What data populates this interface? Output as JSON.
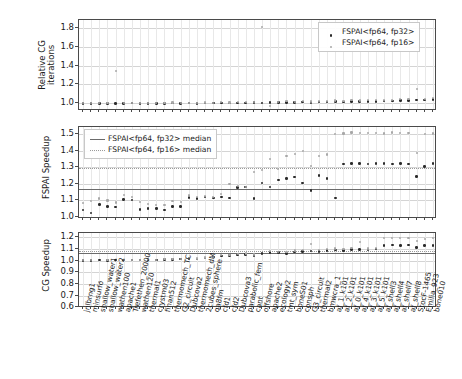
{
  "figure": {
    "type": "multi-panel-scatter",
    "n_matrices": 55
  },
  "chart_data": {
    "type": "scatter",
    "title": "",
    "xlabel": "",
    "legend_position": "top-right (panel 1), top-left (panel 2)",
    "grid": true,
    "categories": [
      "jnlbrng1",
      "minsurfo",
      "shallow_water1",
      "shallow_water2",
      "wathen100",
      "apache1",
      "Trefethen_20000",
      "wathen120",
      "thermal1",
      "crystm03",
      "finan512",
      "thermomech_TC",
      "G2_circuit",
      "Dubcova2",
      "thermomech_dM",
      "2cubes_sphere",
      "qa8fm",
      "cfd1",
      "cfd2",
      "Dubcova3",
      "parabolic_fem",
      "cant",
      "offshore",
      "apache2",
      "ecology2",
      "tmt_sym",
      "boneS01",
      "consph",
      "G3_circuit",
      "thermal2",
      "bmwcra_1",
      "af_1_k101",
      "af_2_k101",
      "af_0_k101",
      "af_4_k101",
      "af_3_k101",
      "af_5_k101",
      "af_shell3",
      "af_shell4",
      "af_shell7",
      "af_shell8",
      "StocF-1465",
      "Emilia_923",
      "bone010"
    ],
    "panels": [
      {
        "id": "relative-cg-iterations",
        "ylabel": "Relative CG\niterations",
        "ylabel_line1": "Relative CG",
        "ylabel_line2": "iterations",
        "yticks": [
          1.0,
          1.2,
          1.4,
          1.6,
          1.8
        ],
        "ylim": [
          0.92,
          1.88
        ],
        "series": [
          {
            "name": "FSPAI<fp64, fp32>",
            "marker": "dot-dark",
            "values": [
              1.0,
              1.001,
              1.0,
              1.0,
              1.002,
              1.001,
              1.003,
              1.0,
              1.002,
              1.001,
              1.0,
              1.004,
              1.002,
              1.003,
              1.002,
              1.004,
              1.003,
              1.005,
              1.004,
              1.006,
              1.005,
              1.008,
              1.006,
              1.01,
              1.008,
              1.012,
              1.01,
              1.014,
              1.012,
              1.016,
              1.014,
              1.018,
              1.016,
              1.02,
              1.018,
              1.022,
              1.02,
              1.024,
              1.026,
              1.028,
              1.03,
              1.034,
              1.038,
              1.044
            ]
          },
          {
            "name": "FSPAI<fp64, fp16>",
            "marker": "dot-light",
            "values": [
              1.002,
              1.003,
              1.002,
              1.004,
              1.34,
              1.003,
              1.006,
              1.004,
              1.006,
              1.005,
              1.004,
              1.01,
              1.006,
              1.008,
              1.006,
              1.01,
              1.008,
              1.012,
              1.01,
              1.014,
              1.012,
              1.018,
              1.81,
              0.975,
              1.016,
              1.022,
              1.018,
              1.024,
              1.02,
              1.028,
              1.024,
              1.03,
              1.026,
              1.034,
              1.03,
              1.036,
              1.032,
              1.038,
              1.04,
              1.044,
              1.046,
              1.15,
              1.05,
              1.056
            ]
          }
        ]
      },
      {
        "id": "fspai-speedup",
        "ylabel": "FSPAI Speedup",
        "yticks": [
          1.0,
          1.1,
          1.2,
          1.3,
          1.4,
          1.5
        ],
        "ylim": [
          0.985,
          1.545
        ],
        "median_lines": [
          {
            "name": "FSPAI<fp64, fp32> median",
            "value": 1.168,
            "style": "solid"
          },
          {
            "name": "FSPAI<fp64, fp16> median",
            "value": 1.297,
            "style": "dotted"
          }
        ],
        "series": [
          {
            "name": "FSPAI<fp64, fp32>",
            "marker": "dot-dark",
            "values": [
              1.04,
              1.022,
              1.075,
              1.062,
              1.058,
              1.105,
              1.1,
              1.042,
              1.05,
              1.048,
              1.04,
              1.06,
              1.062,
              1.115,
              1.108,
              1.118,
              1.112,
              1.12,
              1.112,
              1.175,
              1.18,
              1.108,
              1.205,
              1.18,
              1.222,
              1.232,
              1.24,
              1.205,
              1.16,
              1.248,
              1.232,
              1.112,
              1.32,
              1.322,
              1.324,
              1.32,
              1.322,
              1.324,
              1.32,
              1.322,
              1.32,
              1.244,
              1.305,
              1.322
            ]
          },
          {
            "name": "FSPAI<fp64, fp16>",
            "marker": "dot-light",
            "values": [
              1.08,
              1.095,
              1.11,
              1.098,
              1.085,
              1.13,
              1.118,
              1.09,
              1.075,
              1.072,
              1.07,
              1.095,
              1.09,
              1.128,
              1.12,
              1.125,
              1.118,
              1.138,
              1.2,
              1.185,
              1.178,
              1.272,
              1.282,
              1.348,
              1.29,
              1.37,
              1.382,
              1.4,
              1.31,
              1.37,
              1.378,
              1.5,
              1.505,
              1.512,
              1.506,
              1.508,
              1.51,
              1.505,
              1.512,
              1.508,
              1.51,
              1.385,
              1.5,
              1.505
            ]
          }
        ]
      },
      {
        "id": "cg-speedup",
        "ylabel": "CG Speedup",
        "yticks": [
          0.6,
          0.7,
          0.8,
          0.9,
          1.0,
          1.1,
          1.2
        ],
        "ylim": [
          0.595,
          1.235
        ],
        "median_lines": [
          {
            "name": "FSPAI<fp64, fp32> median",
            "value": 1.062,
            "style": "solid"
          },
          {
            "name": "FSPAI<fp64, fp16> median",
            "value": 1.085,
            "style": "dotted"
          }
        ],
        "series": [
          {
            "name": "FSPAI<fp64, fp32>",
            "marker": "dot-dark",
            "values": [
              1.0,
              1.002,
              1.004,
              1.002,
              1.003,
              1.004,
              1.005,
              1.004,
              1.006,
              1.005,
              1.008,
              1.01,
              1.012,
              1.018,
              1.014,
              1.02,
              1.03,
              1.04,
              1.042,
              1.048,
              1.052,
              1.045,
              1.06,
              1.07,
              1.068,
              1.062,
              1.072,
              1.078,
              1.08,
              1.075,
              1.088,
              1.09,
              1.085,
              1.092,
              1.095,
              1.09,
              1.098,
              1.13,
              1.132,
              1.13,
              1.132,
              1.11,
              1.128,
              1.13
            ]
          },
          {
            "name": "FSPAI<fp64, fp16>",
            "marker": "dot-light",
            "values": [
              1.002,
              1.004,
              0.818,
              1.005,
              0.902,
              1.006,
              1.008,
              1.006,
              1.01,
              1.008,
              1.012,
              1.014,
              1.016,
              1.022,
              1.018,
              1.026,
              1.035,
              1.048,
              1.05,
              1.056,
              1.06,
              1.052,
              0.648,
              1.082,
              1.075,
              1.07,
              1.085,
              1.092,
              1.14,
              1.088,
              1.1,
              1.102,
              1.098,
              1.105,
              1.155,
              1.102,
              1.11,
              1.19,
              1.192,
              1.19,
              1.192,
              1.165,
              1.185,
              1.19
            ]
          }
        ]
      }
    ]
  },
  "legends": {
    "panel1": [
      {
        "label": "FSPAI<fp64, fp32>",
        "marker": "dot-dark"
      },
      {
        "label": "FSPAI<fp64, fp16>",
        "marker": "dot-light"
      }
    ],
    "panel2": [
      {
        "label": "FSPAI<fp64, fp32> median",
        "marker": "line-solid"
      },
      {
        "label": "FSPAI<fp64, fp16> median",
        "marker": "line-dotted"
      }
    ]
  },
  "colors": {
    "fp32": "#2b2b2b",
    "fp16": "#a8a8a8",
    "median32": "#6b6b6b",
    "median16": "#9a9a9a",
    "grid": "#d4d4d4",
    "axis": "#4a4a4a",
    "background": "#ffffff"
  }
}
